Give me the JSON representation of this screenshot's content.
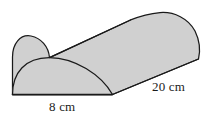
{
  "figure": {
    "shape_name": "half-cylinder",
    "background_color": "#ffffff",
    "fill_color": "#d0d0d0",
    "stroke_color": "#1a1a1a",
    "labels": {
      "width": "8 cm",
      "length": "20 cm"
    },
    "dimensions": [
      {
        "name": "diameter",
        "value": 8,
        "unit": "cm",
        "text": "8 cm"
      },
      {
        "name": "length",
        "value": 20,
        "unit": "cm",
        "text": "20 cm"
      }
    ]
  }
}
